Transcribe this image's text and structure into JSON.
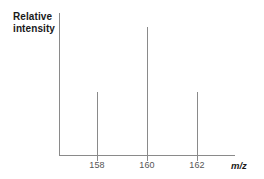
{
  "figure": {
    "name": "mass-spectrum",
    "background_color": "#ffffff",
    "line_color": "#8a8a8a",
    "text_color": "#1a1a1a",
    "tick_label_color": "#555555"
  },
  "axes": {
    "y_label_line1": "Relative",
    "y_label_line2": "intensity",
    "x_label": "m/z"
  },
  "chart_data": {
    "type": "bar",
    "title": "",
    "subtitle": "",
    "xlabel": "m/z",
    "ylabel": "Relative intensity",
    "categories": [
      "158",
      "160",
      "162"
    ],
    "values": [
      47,
      95,
      47
    ],
    "x": [
      158,
      160,
      162
    ],
    "tick_labels": [
      "158",
      "160",
      "162"
    ],
    "xlim": [
      156.5,
      163.5
    ],
    "ylim": [
      0,
      100
    ],
    "y_tick_labels": [],
    "grid": false,
    "legend": false,
    "legend_position": "none",
    "annotations": []
  }
}
